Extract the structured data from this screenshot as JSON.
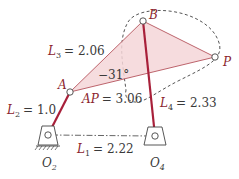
{
  "diagram": {
    "type": "four-bar linkage with coupler point",
    "colors": {
      "link": "#a8203a",
      "coupler_fill": "#f4d6d8",
      "coupler_edge": "#b5545c",
      "dashed": "#555555",
      "text": "#3a3a3a"
    },
    "points": {
      "O2": {
        "label": "O",
        "sub": "2"
      },
      "O4": {
        "label": "O",
        "sub": "4"
      },
      "A": {
        "label": "A"
      },
      "B": {
        "label": "B"
      },
      "P": {
        "label": "P"
      }
    },
    "links": {
      "L1": {
        "name": "L",
        "sub": "1",
        "value": "= 2.22"
      },
      "L2": {
        "name": "L",
        "sub": "2",
        "value": "= 1.0"
      },
      "L3": {
        "name": "L",
        "sub": "3",
        "value": "= 2.06"
      },
      "L4": {
        "name": "L",
        "sub": "4",
        "value": "= 2.33"
      }
    },
    "coupler": {
      "AP_label": "AP",
      "AP_value": "= 3.06",
      "angle": "−31°"
    }
  }
}
